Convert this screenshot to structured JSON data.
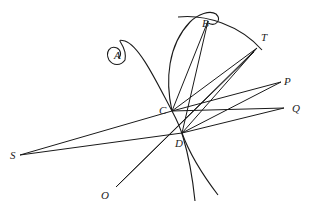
{
  "diagram": {
    "type": "geometric construction",
    "stroke_color": "#1a1a1a",
    "background": "#ffffff",
    "points": {
      "A": {
        "label": "A",
        "x": 117,
        "y": 55,
        "lx": 114,
        "ly": 59
      },
      "B": {
        "label": "B",
        "x": 208,
        "y": 21,
        "lx": 202,
        "ly": 27
      },
      "T": {
        "label": "T",
        "x": 257,
        "y": 48,
        "lx": 261,
        "ly": 41
      },
      "P": {
        "label": "P",
        "x": 281,
        "y": 82,
        "lx": 284,
        "ly": 85
      },
      "Q": {
        "label": "Q",
        "x": 284,
        "y": 108,
        "lx": 292,
        "ly": 112
      },
      "C": {
        "label": "C",
        "x": 172,
        "y": 111,
        "lx": 159,
        "ly": 114
      },
      "D": {
        "label": "D",
        "x": 182,
        "y": 133,
        "lx": 175,
        "ly": 147
      },
      "S": {
        "label": "S",
        "x": 20,
        "y": 155,
        "lx": 10,
        "ly": 159
      },
      "O": {
        "label": "O",
        "x": 116,
        "y": 187,
        "lx": 101,
        "ly": 199
      }
    },
    "segments": [
      [
        "S",
        "C"
      ],
      [
        "S",
        "D"
      ],
      [
        "C",
        "P"
      ],
      [
        "C",
        "Q"
      ],
      [
        "D",
        "P"
      ],
      [
        "D",
        "Q"
      ],
      [
        "C",
        "T"
      ],
      [
        "D",
        "T"
      ],
      [
        "B",
        "C"
      ],
      [
        "B",
        "D"
      ],
      [
        "O",
        "T"
      ],
      [
        "O",
        "T2"
      ]
    ],
    "curves": [
      "spiral from A through C and D down to bottom",
      "loop from C up through B",
      "arc through B to T",
      "curve from D down-right"
    ]
  }
}
